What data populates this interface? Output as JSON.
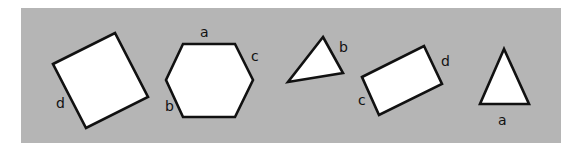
{
  "figure": {
    "background_color": "#ffffff",
    "panel_color": "#b5b5b5",
    "shape_fill": "#ffffff",
    "shape_stroke": "#111111"
  },
  "shapes": [
    {
      "type": "square",
      "points": "53,64 115,33 148,97 86,128",
      "labels": [
        {
          "text": "d",
          "x": 56,
          "y": 108
        }
      ]
    },
    {
      "type": "hexagon",
      "points": "183,44 235,44 253,80 235,117 183,117 166,80",
      "labels": [
        {
          "text": "a",
          "x": 200,
          "y": 37
        },
        {
          "text": "c",
          "x": 251,
          "y": 61
        },
        {
          "text": "b",
          "x": 165,
          "y": 111
        }
      ]
    },
    {
      "type": "triangle",
      "points": "323,37 343,73 288,82",
      "labels": [
        {
          "text": "b",
          "x": 339,
          "y": 52
        }
      ]
    },
    {
      "type": "rectangle",
      "points": "362,77 424,46 442,84 379,115",
      "labels": [
        {
          "text": "d",
          "x": 441,
          "y": 66
        },
        {
          "text": "c",
          "x": 358,
          "y": 105
        }
      ]
    },
    {
      "type": "equilateral-triangle",
      "points": "504,49 480,104 529,104",
      "labels": [
        {
          "text": "a",
          "x": 498,
          "y": 125
        }
      ]
    }
  ]
}
